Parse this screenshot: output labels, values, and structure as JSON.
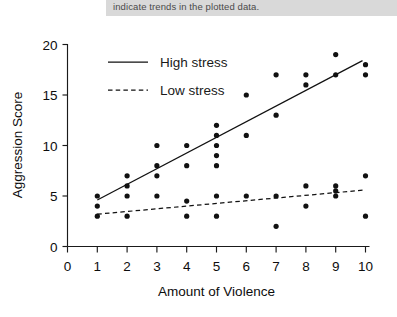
{
  "caption": {
    "text": "indicate trends in the plotted data."
  },
  "chart_data": {
    "type": "scatter",
    "title": "",
    "xlabel": "Amount of Violence",
    "ylabel": "Aggression Score",
    "xlim": [
      0,
      10
    ],
    "ylim": [
      0,
      20
    ],
    "xticks": [
      "0",
      "1",
      "2",
      "3",
      "4",
      "5",
      "6",
      "7",
      "8",
      "9",
      "10"
    ],
    "yticks": [
      "0",
      "5",
      "10",
      "15",
      "20"
    ],
    "grid": false,
    "legend_position": "top-left",
    "marker_color": "#111111",
    "line_color": "#111111",
    "series": [
      {
        "name": "High stress",
        "line_style": "solid",
        "points": [
          [
            1,
            5
          ],
          [
            2,
            7
          ],
          [
            2,
            6
          ],
          [
            3,
            10
          ],
          [
            3,
            8
          ],
          [
            3,
            7
          ],
          [
            4,
            10
          ],
          [
            4,
            8
          ],
          [
            5,
            12
          ],
          [
            5,
            11
          ],
          [
            5,
            10
          ],
          [
            5,
            9
          ],
          [
            5,
            8
          ],
          [
            6,
            15
          ],
          [
            6,
            11
          ],
          [
            7,
            17
          ],
          [
            7,
            13
          ],
          [
            8,
            17
          ],
          [
            8,
            16
          ],
          [
            9,
            19
          ],
          [
            9,
            17
          ],
          [
            10,
            18
          ],
          [
            10,
            17
          ]
        ],
        "trend_line": {
          "x0": 1,
          "y0": 4.6,
          "x1": 9.9,
          "y1": 18.4
        }
      },
      {
        "name": "Low stress",
        "line_style": "dashed",
        "points": [
          [
            1,
            4
          ],
          [
            1,
            3
          ],
          [
            2,
            5
          ],
          [
            2,
            3
          ],
          [
            3,
            5
          ],
          [
            4,
            4.5
          ],
          [
            4,
            3
          ],
          [
            5,
            5
          ],
          [
            5,
            3
          ],
          [
            6,
            5
          ],
          [
            7,
            5
          ],
          [
            7,
            2
          ],
          [
            8,
            6
          ],
          [
            8,
            4
          ],
          [
            9,
            6
          ],
          [
            9,
            5.5
          ],
          [
            9,
            5
          ],
          [
            10,
            7
          ],
          [
            10,
            3
          ]
        ],
        "trend_line": {
          "x0": 1,
          "y0": 3.2,
          "x1": 10,
          "y1": 5.6
        }
      }
    ],
    "legend": [
      {
        "label": "High stress",
        "style": "solid"
      },
      {
        "label": "Low stress",
        "style": "dashed"
      }
    ]
  }
}
